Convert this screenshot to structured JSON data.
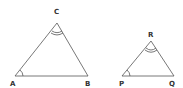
{
  "triangles": [
    {
      "name": "ABC",
      "vertices": {
        "A": {
          "label": "A",
          "x": 15,
          "y": 76
        },
        "B": {
          "label": "B",
          "x": 88,
          "y": 76
        },
        "C": {
          "label": "C",
          "x": 57,
          "y": 23
        }
      },
      "angle_marks": {
        "A": "single-arc",
        "C": "double-arc"
      }
    },
    {
      "name": "PQR",
      "vertices": {
        "P": {
          "label": "P",
          "x": 122,
          "y": 76
        },
        "Q": {
          "label": "Q",
          "x": 174,
          "y": 76
        },
        "R": {
          "label": "R",
          "x": 151,
          "y": 41
        }
      },
      "angle_marks": {
        "P": "single-arc",
        "R": "double-arc"
      }
    }
  ],
  "colors": {
    "line": "#555555",
    "text": "#333333"
  }
}
